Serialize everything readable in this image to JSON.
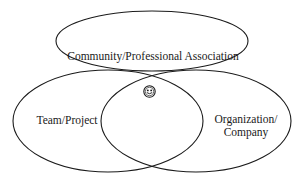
{
  "diagram": {
    "background_color": "#ffffff",
    "stroke_color": "#1b1b1b",
    "sets": [
      {
        "id": "community",
        "label": "Community/Professional Association",
        "position": "top",
        "cx": 152,
        "cy": 41,
        "rx": 96,
        "ry": 30
      },
      {
        "id": "team",
        "label": "Team/Project",
        "position": "bottom-left",
        "cx": 108,
        "cy": 121,
        "rx": 95,
        "ry": 51
      },
      {
        "id": "organization",
        "label": "Organization/ Company",
        "label_line1": "Organization/",
        "label_line2": "Company",
        "position": "bottom-right",
        "cx": 196,
        "cy": 121,
        "rx": 95,
        "ry": 51
      }
    ],
    "center_marker": {
      "icon": "smiley-face-icon",
      "description": "small circular face representing a person at the intersection",
      "cx": 149.5,
      "cy": 91.5,
      "r": 6.2
    }
  }
}
